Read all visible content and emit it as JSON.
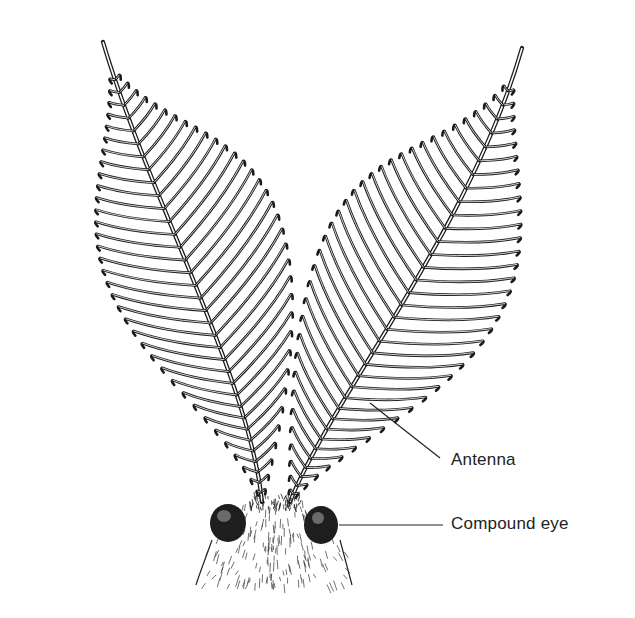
{
  "figure": {
    "labels": [
      {
        "id": "antenna",
        "text": "Antenna",
        "pointer_from": [
          447,
          460
        ],
        "pointer_to": [
          370,
          403
        ]
      },
      {
        "id": "eye",
        "text": "Compound eye",
        "pointer_from": [
          445,
          525
        ],
        "pointer_to": [
          338,
          525
        ]
      }
    ],
    "colors": {
      "ink": "#1a1a1a",
      "background": "#ffffff"
    }
  }
}
